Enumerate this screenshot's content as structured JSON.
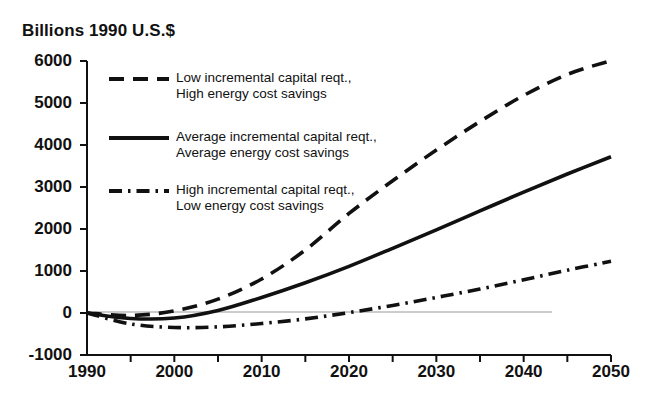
{
  "axis_title": "Billions 1990 U.S.$",
  "legend": [
    {
      "id": "low-capital-high-savings",
      "style": "dashed",
      "line1": "Low incremental capital reqt.,",
      "line2": "High energy cost savings"
    },
    {
      "id": "average-capital-average-savings",
      "style": "solid",
      "line1": "Average incremental capital reqt.,",
      "line2": "Average energy cost savings"
    },
    {
      "id": "high-capital-low-savings",
      "style": "dashdot",
      "line1": "High incremental capital reqt.,",
      "line2": "Low energy cost savings"
    }
  ],
  "chart_data": {
    "type": "line",
    "title": "Billions 1990 U.S.$",
    "xlabel": "",
    "ylabel": "Billions 1990 U.S.$",
    "xlim": [
      1990,
      2050
    ],
    "ylim": [
      -1000,
      6000
    ],
    "grid": false,
    "legend_position": "upper-left-inside",
    "x_ticks": [
      1990,
      2000,
      2010,
      2020,
      2030,
      2040,
      2050
    ],
    "x_minor_ticks": [
      1995,
      2005,
      2015,
      2025,
      2035,
      2045
    ],
    "y_ticks": [
      -1000,
      0,
      1000,
      2000,
      3000,
      4000,
      5000,
      6000
    ],
    "zero_reference_line": 0,
    "x": [
      1990,
      1995,
      2000,
      2005,
      2010,
      2015,
      2020,
      2025,
      2030,
      2035,
      2040,
      2045,
      2050
    ],
    "series": [
      {
        "name": "Low incremental capital reqt., High energy cost savings",
        "style": "dashed",
        "values": [
          0,
          -60,
          50,
          330,
          810,
          1500,
          2370,
          3150,
          3880,
          4560,
          5180,
          5680,
          6010
        ]
      },
      {
        "name": "Average incremental capital reqt., Average energy cost savings",
        "style": "solid",
        "values": [
          0,
          -130,
          -120,
          60,
          370,
          720,
          1110,
          1540,
          1980,
          2430,
          2880,
          3310,
          3720
        ]
      },
      {
        "name": "High incremental capital reqt., Low energy cost savings",
        "style": "dashdot",
        "values": [
          0,
          -260,
          -345,
          -330,
          -250,
          -140,
          10,
          180,
          370,
          570,
          790,
          1020,
          1230
        ]
      }
    ]
  }
}
